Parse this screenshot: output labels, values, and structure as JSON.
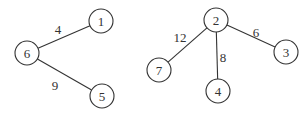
{
  "graph": {
    "nodes": [
      {
        "id": "1",
        "x": 101,
        "y": 21
      },
      {
        "id": "6",
        "x": 27,
        "y": 53
      },
      {
        "id": "5",
        "x": 102,
        "y": 96
      },
      {
        "id": "2",
        "x": 216,
        "y": 20
      },
      {
        "id": "7",
        "x": 159,
        "y": 70
      },
      {
        "id": "4",
        "x": 218,
        "y": 91
      },
      {
        "id": "3",
        "x": 286,
        "y": 52
      }
    ],
    "edges": [
      {
        "from": "6",
        "to": "1",
        "weight": "4",
        "lx": 58,
        "ly": 34
      },
      {
        "from": "6",
        "to": "5",
        "weight": "9",
        "lx": 55,
        "ly": 90
      },
      {
        "from": "2",
        "to": "7",
        "weight": "12",
        "lx": 180,
        "ly": 42
      },
      {
        "from": "2",
        "to": "4",
        "weight": "8",
        "lx": 223,
        "ly": 62
      },
      {
        "from": "2",
        "to": "3",
        "weight": "6",
        "lx": 256,
        "ly": 37
      }
    ],
    "node_radius": 12
  }
}
